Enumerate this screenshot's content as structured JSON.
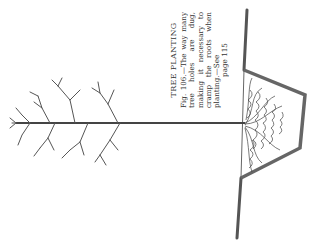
{
  "figure": {
    "title": "TREE PLANTING",
    "caption": "Fig. 106.—The way many tree holes are dug, making it necessary to cramp the roots when planting.—See",
    "page_ref": "page 115",
    "orientation": "rotated 90° counter-clockwise",
    "colors": {
      "ink": "#3a3a3a",
      "paper": "#ffffff"
    }
  }
}
